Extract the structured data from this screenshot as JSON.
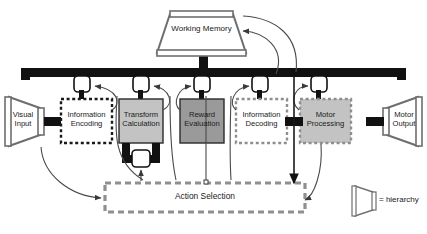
{
  "diagram": {
    "background": "#ffffff"
  },
  "colors": {
    "bus_black": "#111111",
    "box_gray_light": "#c3c3c3",
    "box_gray_dark": "#9a9a9a",
    "box_white": "#ffffff",
    "dashed_black": "#1a1a1a",
    "dashed_gray": "#8f8f8f",
    "outline_gray": "#6e6e6e",
    "text": "#1a1a1a"
  },
  "nodes": {
    "working_memory": {
      "label": "Working Memory",
      "shape": "hierarchy-trapezoid",
      "fill": "#ffffff"
    },
    "visual_input": {
      "label_line1": "Visual",
      "label_line2": "Input",
      "shape": "hierarchy-trapezoid-right",
      "fill": "#ffffff"
    },
    "information_encoding": {
      "label_line1": "Information",
      "label_line2": "Encoding",
      "shape": "dashed-box",
      "border": "dashed-black",
      "fill": "#ffffff"
    },
    "transform_calculation": {
      "label_line1": "Transform",
      "label_line2": "Calculation",
      "shape": "solid-box",
      "border": "solid-black",
      "fill": "#c3c3c3"
    },
    "reward_evaluation": {
      "label_line1": "Reward",
      "label_line2": "Evaluation",
      "shape": "solid-box",
      "border": "solid-black",
      "fill": "#9a9a9a"
    },
    "information_decoding": {
      "label_line1": "Information",
      "label_line2": "Decoding",
      "shape": "dashed-box",
      "border": "dashed-gray",
      "fill": "#ffffff"
    },
    "motor_processing": {
      "label_line1": "Motor",
      "label_line2": "Processing",
      "shape": "dashed-box",
      "border": "dashed-gray",
      "fill": "#c3c3c3"
    },
    "motor_output": {
      "label_line1": "Motor",
      "label_line2": "Output",
      "shape": "hierarchy-trapezoid-left",
      "fill": "#ffffff"
    },
    "action_selection": {
      "label": "Action Selection",
      "shape": "dashed-box",
      "border": "dashed-gray-thick",
      "fill": "#ffffff"
    }
  },
  "legend": {
    "symbol_name": "hierarchy-trapezoid-icon",
    "text": "= hierarchy"
  },
  "bus": {
    "name": "communication-bus",
    "gate_count": 5,
    "gate_name": "gate-node"
  }
}
